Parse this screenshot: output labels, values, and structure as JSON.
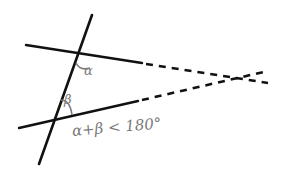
{
  "diagram": {
    "labels": {
      "alpha": "α",
      "beta": "β",
      "condition": "α+β < 180°"
    },
    "colors": {
      "lines": "#111111",
      "labels": "#7a7a7a",
      "background": "#ffffff"
    },
    "elements": {
      "transversal": {
        "from": [
          92,
          15
        ],
        "to": [
          39,
          164
        ]
      },
      "upper_line_solid": {
        "from": [
          26,
          45
        ],
        "to": [
          142,
          63
        ]
      },
      "upper_line_dashed": {
        "from": [
          142,
          63
        ],
        "to": [
          268,
          83
        ]
      },
      "lower_line_solid": {
        "from": [
          19,
          128
        ],
        "to": [
          138,
          101
        ]
      },
      "lower_line_dashed": {
        "from": [
          138,
          101
        ],
        "to": [
          268,
          71
        ]
      },
      "intersection_point": [
        243,
        76
      ]
    }
  }
}
